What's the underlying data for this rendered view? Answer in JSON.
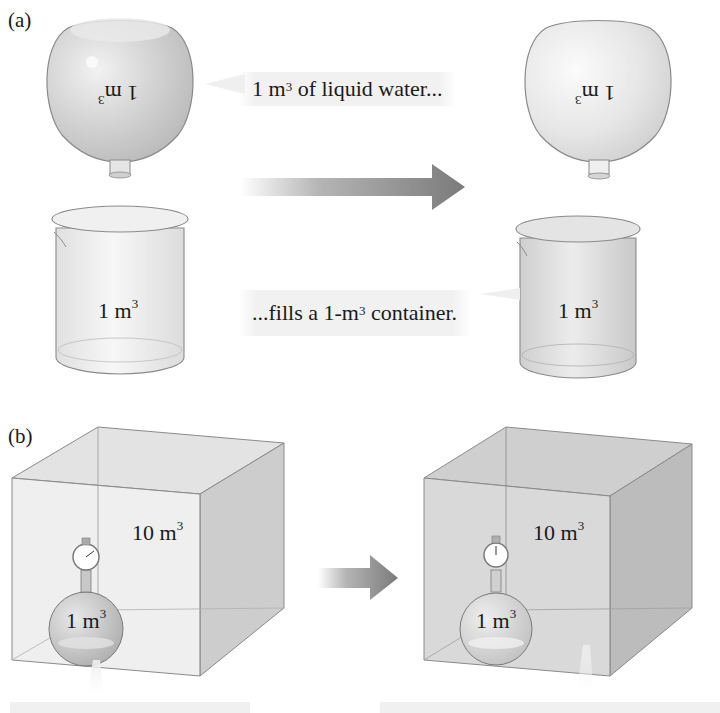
{
  "panel_a": {
    "label": "(a)",
    "flask_left_label": {
      "num": "1 m",
      "exp": "3"
    },
    "flask_right_label": {
      "num": "1 m",
      "exp": "3"
    },
    "beaker_left_label": {
      "num": "1 m",
      "exp": "3"
    },
    "beaker_right_label": {
      "num": "1 m",
      "exp": "3"
    },
    "callout_top": {
      "pre": "1 m",
      "exp": "3",
      "post": " of liquid water..."
    },
    "callout_bottom": {
      "pre": "...fills a 1-m",
      "exp": "3",
      "post": " container."
    }
  },
  "panel_b": {
    "label": "(b)",
    "box_left_label": {
      "num": "10 m",
      "exp": "3"
    },
    "box_right_label": {
      "num": "10 m",
      "exp": "3"
    },
    "flask_left_label": {
      "num": "1 m",
      "exp": "3"
    },
    "flask_right_label": {
      "num": "1 m",
      "exp": "3"
    }
  },
  "colors": {
    "glass_fill": "#d9d9d9",
    "glass_stroke": "#8a8a8a",
    "arrow": "#7d7d7d",
    "callout_bg": "#f1f1f1"
  }
}
